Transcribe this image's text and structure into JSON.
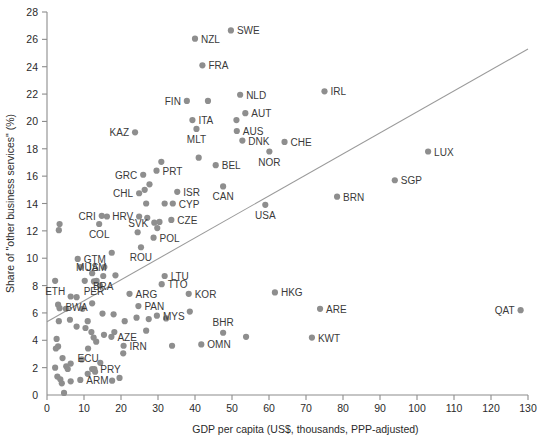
{
  "chart_data": {
    "type": "scatter",
    "title": "",
    "xlabel": "GDP per capita (US$, thousands, PPP-adjusted)",
    "ylabel": "Share of \"other business services\" (%)",
    "xlim": [
      0,
      130
    ],
    "ylim": [
      0,
      28
    ],
    "xticks": [
      0,
      10,
      20,
      30,
      40,
      50,
      60,
      70,
      80,
      90,
      100,
      110,
      120,
      130
    ],
    "yticks": [
      0,
      2,
      4,
      6,
      8,
      10,
      12,
      14,
      16,
      18,
      20,
      22,
      24,
      26,
      28
    ],
    "grid": false,
    "legend": null,
    "dot_color": "#8e8e8e",
    "trend_color": "#9a9a9a",
    "trendline": {
      "x": [
        0,
        130
      ],
      "y": [
        5.35,
        25.3
      ]
    },
    "labeled_points": [
      {
        "label": "SWE",
        "x": 49.7,
        "y": 26.65,
        "lx": "right"
      },
      {
        "label": "NZL",
        "x": 40.0,
        "y": 26.05,
        "lx": "right"
      },
      {
        "label": "FRA",
        "x": 42.0,
        "y": 24.1,
        "lx": "right"
      },
      {
        "label": "NLD",
        "x": 52.2,
        "y": 21.95,
        "lx": "right"
      },
      {
        "label": "FIN",
        "x": 37.8,
        "y": 21.5,
        "lx": "left"
      },
      {
        "label": "AUT",
        "x": 53.6,
        "y": 20.6,
        "lx": "right"
      },
      {
        "label": "ITA",
        "x": 39.3,
        "y": 20.1,
        "lx": "right"
      },
      {
        "label": "AUS",
        "x": 51.3,
        "y": 19.3,
        "lx": "right"
      },
      {
        "label": "KAZ",
        "x": 23.8,
        "y": 19.2,
        "lx": "left"
      },
      {
        "label": "MLT",
        "x": 40.4,
        "y": 19.45,
        "lx": "below"
      },
      {
        "label": "DNK",
        "x": 52.8,
        "y": 18.6,
        "lx": "right"
      },
      {
        "label": "CHE",
        "x": 64.2,
        "y": 18.5,
        "lx": "right"
      },
      {
        "label": "NOR",
        "x": 60.1,
        "y": 17.8,
        "lx": "below"
      },
      {
        "label": "BEL",
        "x": 45.6,
        "y": 16.8,
        "lx": "right"
      },
      {
        "label": "PRT",
        "x": 29.6,
        "y": 16.4,
        "lx": "right"
      },
      {
        "label": "GRC",
        "x": 26.0,
        "y": 16.1,
        "lx": "left"
      },
      {
        "label": "SGP",
        "x": 94.0,
        "y": 15.7,
        "lx": "right"
      },
      {
        "label": "IRL",
        "x": 75.0,
        "y": 22.2,
        "lx": "right"
      },
      {
        "label": "LUX",
        "x": 103.0,
        "y": 17.8,
        "lx": "right"
      },
      {
        "label": "BRN",
        "x": 78.4,
        "y": 14.5,
        "lx": "right"
      },
      {
        "label": "CAN",
        "x": 47.6,
        "y": 15.25,
        "lx": "below"
      },
      {
        "label": "CHL",
        "x": 24.9,
        "y": 14.75,
        "lx": "left"
      },
      {
        "label": "ISR",
        "x": 35.2,
        "y": 14.85,
        "lx": "right"
      },
      {
        "label": "CYP",
        "x": 34.0,
        "y": 14.0,
        "lx": "right"
      },
      {
        "label": "CZE",
        "x": 33.6,
        "y": 12.8,
        "lx": "right"
      },
      {
        "label": "USA",
        "x": 59.0,
        "y": 13.9,
        "lx": "below"
      },
      {
        "label": "CRI",
        "x": 14.8,
        "y": 13.1,
        "lx": "left"
      },
      {
        "label": "HRV",
        "x": 24.9,
        "y": 13.05,
        "lx": "left"
      },
      {
        "label": "SVK",
        "x": 29.0,
        "y": 12.6,
        "lx": "left"
      },
      {
        "label": "COL",
        "x": 14.1,
        "y": 12.5,
        "lx": "below"
      },
      {
        "label": "POL",
        "x": 28.8,
        "y": 11.5,
        "lx": "right"
      },
      {
        "label": "ROU",
        "x": 25.4,
        "y": 10.8,
        "lx": "below"
      },
      {
        "label": "GTM",
        "x": 8.3,
        "y": 9.95,
        "lx": "right"
      },
      {
        "label": "JAM",
        "x": 9.1,
        "y": 9.35,
        "lx": "right"
      },
      {
        "label": "MUS",
        "x": 15.5,
        "y": 9.35,
        "lx": "left"
      },
      {
        "label": "LTU",
        "x": 31.8,
        "y": 8.7,
        "lx": "right"
      },
      {
        "label": "TTO",
        "x": 31.0,
        "y": 8.1,
        "lx": "right"
      },
      {
        "label": "ETH",
        "x": 2.2,
        "y": 8.35,
        "lx": "below"
      },
      {
        "label": "PER",
        "x": 12.7,
        "y": 8.3,
        "lx": "below"
      },
      {
        "label": "BRA",
        "x": 15.2,
        "y": 8.7,
        "lx": "below"
      },
      {
        "label": "KOR",
        "x": 38.3,
        "y": 7.4,
        "lx": "right"
      },
      {
        "label": "ARG",
        "x": 22.3,
        "y": 7.4,
        "lx": "right"
      },
      {
        "label": "BWA",
        "x": 8.0,
        "y": 7.15,
        "lx": "below"
      },
      {
        "label": "PAN",
        "x": 24.7,
        "y": 6.5,
        "lx": "right"
      },
      {
        "label": "HKG",
        "x": 61.6,
        "y": 7.5,
        "lx": "right"
      },
      {
        "label": "MYS",
        "x": 29.7,
        "y": 5.8,
        "lx": "right"
      },
      {
        "label": "ARE",
        "x": 73.8,
        "y": 6.3,
        "lx": "right"
      },
      {
        "label": "QAT",
        "x": 128.0,
        "y": 6.2,
        "lx": "left"
      },
      {
        "label": "BHR",
        "x": 47.6,
        "y": 4.55,
        "lx": "above"
      },
      {
        "label": "KWT",
        "x": 71.6,
        "y": 4.2,
        "lx": "right"
      },
      {
        "label": "OMN",
        "x": 41.7,
        "y": 3.7,
        "lx": "right"
      },
      {
        "label": "AZE",
        "x": 17.4,
        "y": 4.25,
        "lx": "right"
      },
      {
        "label": "IRN",
        "x": 20.7,
        "y": 3.6,
        "lx": "right"
      },
      {
        "label": "ECU",
        "x": 11.1,
        "y": 3.4,
        "lx": "below"
      },
      {
        "label": "PRY",
        "x": 12.8,
        "y": 1.9,
        "lx": "right"
      },
      {
        "label": "ARM",
        "x": 9.0,
        "y": 1.1,
        "lx": "right"
      }
    ],
    "unlabeled_points": [
      {
        "x": 43.5,
        "y": 21.5
      },
      {
        "x": 51.2,
        "y": 20.1
      },
      {
        "x": 41.0,
        "y": 17.35
      },
      {
        "x": 30.9,
        "y": 17.05
      },
      {
        "x": 27.7,
        "y": 15.4
      },
      {
        "x": 26.4,
        "y": 15.0
      },
      {
        "x": 26.8,
        "y": 14.0
      },
      {
        "x": 31.8,
        "y": 14.0
      },
      {
        "x": 27.1,
        "y": 12.95
      },
      {
        "x": 16.2,
        "y": 13.05
      },
      {
        "x": 30.4,
        "y": 12.65
      },
      {
        "x": 29.8,
        "y": 12.2
      },
      {
        "x": 3.4,
        "y": 12.5
      },
      {
        "x": 3.2,
        "y": 12.05
      },
      {
        "x": 17.5,
        "y": 10.4
      },
      {
        "x": 24.5,
        "y": 11.9
      },
      {
        "x": 10.2,
        "y": 8.35
      },
      {
        "x": 12.2,
        "y": 8.9
      },
      {
        "x": 13.4,
        "y": 8.35
      },
      {
        "x": 14.3,
        "y": 8.0
      },
      {
        "x": 18.5,
        "y": 8.75
      },
      {
        "x": 3.0,
        "y": 6.6
      },
      {
        "x": 3.4,
        "y": 6.35
      },
      {
        "x": 5.1,
        "y": 6.3
      },
      {
        "x": 6.4,
        "y": 7.2
      },
      {
        "x": 9.6,
        "y": 6.3
      },
      {
        "x": 12.2,
        "y": 6.7
      },
      {
        "x": 15.0,
        "y": 5.95
      },
      {
        "x": 18.0,
        "y": 5.9
      },
      {
        "x": 38.6,
        "y": 6.1
      },
      {
        "x": 53.8,
        "y": 4.25
      },
      {
        "x": 21.0,
        "y": 5.4
      },
      {
        "x": 24.2,
        "y": 5.65
      },
      {
        "x": 27.5,
        "y": 5.55
      },
      {
        "x": 32.2,
        "y": 5.6
      },
      {
        "x": 26.8,
        "y": 4.7
      },
      {
        "x": 3.2,
        "y": 5.4
      },
      {
        "x": 6.2,
        "y": 5.5
      },
      {
        "x": 8.0,
        "y": 5.0
      },
      {
        "x": 10.4,
        "y": 4.9
      },
      {
        "x": 11.0,
        "y": 5.4
      },
      {
        "x": 12.0,
        "y": 4.6
      },
      {
        "x": 12.6,
        "y": 4.2
      },
      {
        "x": 13.3,
        "y": 3.9
      },
      {
        "x": 15.4,
        "y": 4.4
      },
      {
        "x": 18.2,
        "y": 4.6
      },
      {
        "x": 2.6,
        "y": 4.1
      },
      {
        "x": 3.0,
        "y": 3.55
      },
      {
        "x": 2.4,
        "y": 3.4
      },
      {
        "x": 4.2,
        "y": 2.7
      },
      {
        "x": 5.2,
        "y": 2.1
      },
      {
        "x": 5.6,
        "y": 1.9
      },
      {
        "x": 6.4,
        "y": 2.3
      },
      {
        "x": 9.4,
        "y": 2.6
      },
      {
        "x": 11.0,
        "y": 1.55
      },
      {
        "x": 12.2,
        "y": 1.9
      },
      {
        "x": 13.0,
        "y": 1.7
      },
      {
        "x": 14.4,
        "y": 2.35
      },
      {
        "x": 2.8,
        "y": 1.35
      },
      {
        "x": 3.6,
        "y": 1.15
      },
      {
        "x": 4.0,
        "y": 0.85
      },
      {
        "x": 4.6,
        "y": 0.15
      },
      {
        "x": 6.4,
        "y": 1.0
      },
      {
        "x": 17.6,
        "y": 1.05
      },
      {
        "x": 19.6,
        "y": 1.25
      },
      {
        "x": 2.2,
        "y": 2.0
      },
      {
        "x": 33.8,
        "y": 3.6
      },
      {
        "x": 20.6,
        "y": 3.05
      }
    ]
  }
}
